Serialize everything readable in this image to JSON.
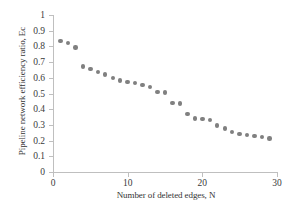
{
  "chart_data": {
    "type": "scatter",
    "title": "",
    "xlabel": "Number of deleted edges, N",
    "ylabel": "Pipeline network efficiency ratio, Ec",
    "xlim": [
      0,
      30
    ],
    "ylim": [
      0,
      1
    ],
    "xticks": [
      0,
      10,
      20,
      30
    ],
    "xtick_labels": [
      "0",
      "10",
      "20",
      "30"
    ],
    "yticks": [
      0,
      0.1,
      0.2,
      0.3,
      0.4,
      0.5,
      0.6,
      0.7,
      0.8,
      0.9,
      1
    ],
    "ytick_labels": [
      "0",
      "0.1",
      "0.2",
      "0.3",
      "0.4",
      "0.5",
      "0.6",
      "0.7",
      "0.8",
      "0.9",
      "1"
    ],
    "grid": false,
    "legend": null,
    "marker_color": "#808080",
    "axis_color": "#bfbfbf",
    "x": [
      1,
      2,
      3,
      4,
      5,
      6,
      7,
      8,
      9,
      10,
      11,
      12,
      13,
      14,
      15,
      16,
      17,
      18,
      19,
      20,
      21,
      22,
      23,
      24,
      25,
      26,
      27,
      28,
      29
    ],
    "values": [
      0.835,
      0.822,
      0.792,
      0.672,
      0.657,
      0.637,
      0.622,
      0.597,
      0.582,
      0.573,
      0.566,
      0.556,
      0.541,
      0.511,
      0.506,
      0.439,
      0.437,
      0.371,
      0.341,
      0.336,
      0.331,
      0.297,
      0.277,
      0.256,
      0.241,
      0.236,
      0.228,
      0.224,
      0.213
    ]
  }
}
